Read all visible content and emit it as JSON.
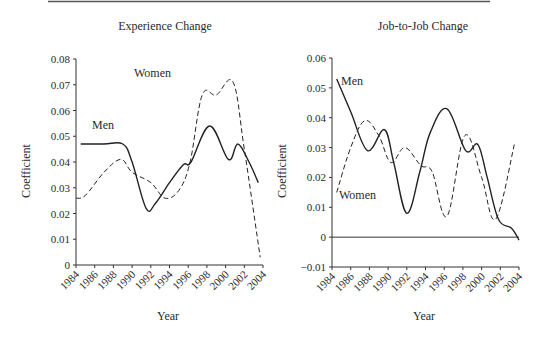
{
  "chart_data": [
    {
      "type": "line",
      "title": "Experience Change",
      "xlabel": "Year",
      "ylabel": "Coefficient",
      "xlim": [
        1984,
        2004
      ],
      "ylim": [
        0,
        0.08
      ],
      "x_ticks": [
        "1984",
        "1986",
        "1988",
        "1990",
        "1992",
        "1994",
        "1996",
        "1998",
        "2000",
        "2002",
        "2004"
      ],
      "y_ticks": [
        "0",
        "0.01",
        "0.02",
        "0.03",
        "0.04",
        "0.05",
        "0.06",
        "0.07",
        "0.08"
      ],
      "grid": false,
      "series": [
        {
          "name": "Men",
          "style": "solid",
          "x": [
            1984.5,
            1987,
            1989,
            1990,
            1991.5,
            1992.5,
            1994,
            1995.5,
            1996.3,
            1998.3,
            2000.3,
            2001.3,
            2002.5,
            2003.5
          ],
          "values": [
            0.047,
            0.047,
            0.047,
            0.04,
            0.022,
            0.024,
            0.032,
            0.039,
            0.04,
            0.054,
            0.041,
            0.047,
            0.04,
            0.032
          ]
        },
        {
          "name": "Women",
          "style": "dashed",
          "x": [
            1984,
            1985,
            1987,
            1988.8,
            1990,
            1992,
            1993.5,
            1995,
            1996.2,
            1997.5,
            1999,
            2000.8,
            2002,
            2003.7
          ],
          "values": [
            0.026,
            0.027,
            0.036,
            0.041,
            0.036,
            0.032,
            0.026,
            0.029,
            0.04,
            0.066,
            0.066,
            0.071,
            0.045,
            0.003
          ]
        }
      ],
      "annotations": [
        {
          "text": "Men",
          "x": 1986,
          "y": 0.05
        },
        {
          "text": "Women",
          "x": 1996,
          "y": 0.07
        }
      ]
    },
    {
      "type": "line",
      "title": "Job-to-Job Change",
      "xlabel": "Year",
      "ylabel": "Coefficient",
      "xlim": [
        1984,
        2004
      ],
      "ylim": [
        -0.01,
        0.06
      ],
      "x_ticks": [
        "1984",
        "1986",
        "1988",
        "1990",
        "1992",
        "1994",
        "1996",
        "1998",
        "2000",
        "2002",
        "2004"
      ],
      "y_ticks": [
        "-0.01",
        "0",
        "0.01",
        "0.02",
        "0.03",
        "0.04",
        "0.05",
        "0.06"
      ],
      "grid": false,
      "zero_line": true,
      "series": [
        {
          "name": "Men",
          "style": "solid",
          "x": [
            1984.5,
            1986,
            1987.8,
            1989.6,
            1990.6,
            1992,
            1993.4,
            1994.5,
            1996.3,
            1998.3,
            1999.6,
            2000.6,
            2001.8,
            2003.2,
            2004
          ],
          "values": [
            0.053,
            0.042,
            0.029,
            0.036,
            0.025,
            0.008,
            0.022,
            0.035,
            0.043,
            0.029,
            0.031,
            0.02,
            0.006,
            0.003,
            -0.001
          ]
        },
        {
          "name": "Women",
          "style": "dashed",
          "x": [
            1984.5,
            1986,
            1987.5,
            1989,
            1990.3,
            1991.8,
            1993.5,
            1994.7,
            1996.3,
            1998.2,
            2000,
            2001.5,
            2003.5
          ],
          "values": [
            0.015,
            0.03,
            0.039,
            0.034,
            0.025,
            0.03,
            0.024,
            0.022,
            0.007,
            0.034,
            0.02,
            0.006,
            0.031
          ]
        }
      ],
      "annotations": [
        {
          "text": "Men",
          "x": 1986,
          "y": 0.052
        },
        {
          "text": "Women",
          "x": 1985,
          "y": 0.013
        }
      ]
    }
  ]
}
